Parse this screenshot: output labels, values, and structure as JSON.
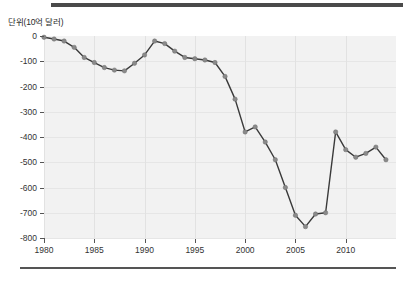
{
  "chart_data": {
    "type": "line",
    "title": "",
    "subtitle": "",
    "unit_label": "단위(10억 달러)",
    "xlabel": "",
    "ylabel": "",
    "xlim": [
      1980,
      2015
    ],
    "ylim": [
      -800,
      0
    ],
    "y_ticks": [
      0,
      -100,
      -200,
      -300,
      -400,
      -500,
      -600,
      -700,
      -800
    ],
    "y_tick_labels": [
      "0",
      "-100",
      "-200",
      "-300",
      "-400",
      "-500",
      "-600",
      "-700",
      "-800"
    ],
    "x_ticks": [
      1980,
      1985,
      1990,
      1995,
      2000,
      2005,
      2010
    ],
    "x_tick_labels": [
      "1980",
      "1985",
      "1990",
      "1995",
      "2000",
      "2005",
      "2010"
    ],
    "grid": true,
    "legend": null,
    "legend_position": "none",
    "line_color": "#3a3a3a",
    "marker_color": "#8a8a8a",
    "plot_background": "#f2f2f2",
    "x": [
      1980,
      1981,
      1982,
      1983,
      1984,
      1985,
      1986,
      1987,
      1988,
      1989,
      1990,
      1991,
      1992,
      1993,
      1994,
      1995,
      1996,
      1997,
      1998,
      1999,
      2000,
      2001,
      2002,
      2003,
      2004,
      2005,
      2006,
      2007,
      2008,
      2009,
      2010,
      2011,
      2012,
      2013,
      2014
    ],
    "values": [
      -5,
      -12,
      -20,
      -45,
      -85,
      -105,
      -125,
      -135,
      -138,
      -108,
      -75,
      -20,
      -30,
      -60,
      -85,
      -90,
      -95,
      -105,
      -160,
      -250,
      -380,
      -360,
      -420,
      -490,
      -600,
      -710,
      -755,
      -705,
      -700,
      -380,
      -450,
      -480,
      -465,
      -440,
      -490
    ],
    "series": [
      {
        "name": "",
        "values": [
          -5,
          -12,
          -20,
          -45,
          -85,
          -105,
          -125,
          -135,
          -138,
          -108,
          -75,
          -20,
          -30,
          -60,
          -85,
          -90,
          -95,
          -105,
          -160,
          -250,
          -380,
          -360,
          -420,
          -490,
          -600,
          -710,
          -755,
          -705,
          -700,
          -380,
          -450,
          -480,
          -465,
          -440,
          -490
        ]
      }
    ],
    "annotations": []
  }
}
